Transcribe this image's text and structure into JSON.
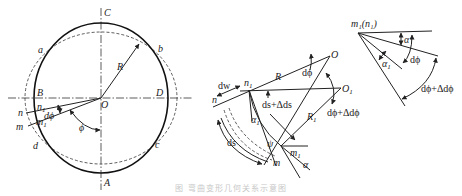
{
  "figure": {
    "caption": "图 弯曲变形几何关系示意图",
    "left_panel": {
      "points": {
        "C": "C",
        "A": "A",
        "B": "B",
        "D": "D",
        "O": "O",
        "a": "a",
        "b": "b",
        "c": "c",
        "d": "d",
        "n": "n",
        "n1_base": "n",
        "n1_sub": "1",
        "m": "m",
        "m1_base": "m",
        "m1_sub": "1"
      },
      "radius_label": "R",
      "angle_labels": {
        "dphi": "dϕ",
        "phi": "ϕ"
      }
    },
    "middle_panel": {
      "points": {
        "O": "O",
        "O1_base": "O",
        "O1_sub": "1",
        "n": "n",
        "n1_base": "n",
        "n1_sub": "1",
        "m": "m",
        "m1_base": "m",
        "m1_sub": "1",
        "psi": "ψ"
      },
      "labels": {
        "R": "R",
        "R1_base": "R",
        "R1_sub": "1",
        "dw": "dw",
        "dphi": "dϕ",
        "ds_plus": "ds+Δds",
        "dphi_plus": "dϕ+Δdϕ",
        "ds": "ds",
        "alpha1_base": "α",
        "alpha1_sub": "1",
        "alpha": "α"
      }
    },
    "right_panel": {
      "vertex_label": "m₁(n₁)",
      "labels": {
        "alpha": "α",
        "dphi": "dϕ",
        "alpha1_base": "α",
        "alpha1_sub": "1",
        "dphi_plus": "dϕ+Δdϕ"
      }
    }
  }
}
